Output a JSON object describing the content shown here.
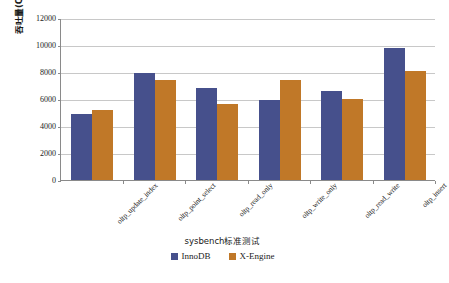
{
  "chart_data": {
    "type": "bar",
    "title": "",
    "subtitle": "",
    "xlabel": "sysbench标准测试",
    "ylabel": "吞吐量(QPS/TPS)",
    "categories": [
      "oltp_update_index",
      "oltp_point_select",
      "oltp_read_only",
      "oltp_write_only",
      "oltp_read_write",
      "oltp_insert"
    ],
    "series": [
      {
        "name": "InnoDB",
        "color": "#46508C",
        "values": [
          4900,
          7950,
          6800,
          5900,
          6600,
          9750
        ]
      },
      {
        "name": "X-Engine",
        "color": "#C07828",
        "values": [
          5150,
          7400,
          5600,
          7400,
          6000,
          8050
        ]
      }
    ],
    "ylim": [
      0,
      12000
    ],
    "ytick_step": 2000,
    "yticks": [
      0,
      2000,
      4000,
      6000,
      8000,
      10000,
      12000
    ],
    "ytick_labels": [
      "0",
      "2000",
      "4000",
      "6000",
      "8000",
      "10000",
      "12000"
    ],
    "grid": true,
    "grid_axis": "y",
    "legend_position": "bottom",
    "xtick_rotation": -45
  },
  "colors": {
    "series_innodb": "#46508C",
    "series_xengine": "#C07828",
    "gridline": "#C8C8C8",
    "axis": "#8A8A8A",
    "text": "#1A1A1A",
    "background": "#FFFFFF"
  }
}
